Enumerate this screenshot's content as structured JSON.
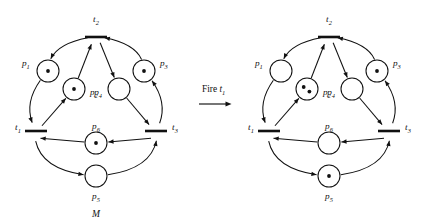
{
  "figure": {
    "caption_left": "M",
    "transition_arrow": {
      "label_prefix": "Fire ",
      "label_transition": "t",
      "label_subscript": "1",
      "icon": "right-arrow-icon"
    },
    "colors": {
      "stroke": "#111111",
      "background": "#ffffff",
      "token": "#111111"
    }
  },
  "nets": [
    {
      "id": "net-before",
      "name": "petri-net-before-firing",
      "marking_label": "M",
      "places": [
        {
          "id": "p1",
          "label": "p",
          "subscript": "1",
          "tokens": 1,
          "cx": 48,
          "cy": 71,
          "r": 11,
          "label_x": 22,
          "label_y": 66,
          "label_anchor": "start"
        },
        {
          "id": "p2",
          "label": "p",
          "subscript": "2",
          "tokens": 1,
          "cx": 74,
          "cy": 89,
          "r": 11,
          "label_x": 90,
          "label_y": 95,
          "label_anchor": "start"
        },
        {
          "id": "p3",
          "label": "p",
          "subscript": "3",
          "tokens": 1,
          "cx": 144,
          "cy": 71,
          "r": 11,
          "label_x": 160,
          "label_y": 66,
          "label_anchor": "start"
        },
        {
          "id": "p4",
          "label": "p",
          "subscript": "4",
          "tokens": 0,
          "cx": 119,
          "cy": 89,
          "r": 11,
          "label_x": 102,
          "label_y": 95,
          "label_anchor": "end"
        },
        {
          "id": "p5",
          "label": "p",
          "subscript": "5",
          "tokens": 0,
          "cx": 96,
          "cy": 176,
          "r": 11,
          "label_x": 96,
          "label_y": 199,
          "label_anchor": "middle"
        },
        {
          "id": "p6",
          "label": "p",
          "subscript": "6",
          "tokens": 1,
          "cx": 96,
          "cy": 143,
          "r": 11,
          "label_x": 96,
          "label_y": 129,
          "label_anchor": "middle"
        }
      ],
      "transitions": [
        {
          "id": "t1",
          "label": "t",
          "subscript": "1",
          "x": 36,
          "y": 131,
          "half": 11,
          "label_x": 18,
          "label_y": 130,
          "label_anchor": "middle"
        },
        {
          "id": "t2",
          "label": "t",
          "subscript": "2",
          "x": 96,
          "y": 37,
          "half": 11,
          "label_x": 96,
          "label_y": 22,
          "label_anchor": "middle"
        },
        {
          "id": "t3",
          "label": "t",
          "subscript": "3",
          "x": 156,
          "y": 131,
          "half": 11,
          "label_x": 175,
          "label_y": 130,
          "label_anchor": "middle"
        }
      ]
    },
    {
      "id": "net-after",
      "name": "petri-net-after-firing",
      "marking_label": "",
      "places": [
        {
          "id": "p1",
          "label": "p",
          "subscript": "1",
          "tokens": 0,
          "cx": 48,
          "cy": 71,
          "r": 11,
          "label_x": 22,
          "label_y": 66,
          "label_anchor": "start"
        },
        {
          "id": "p2",
          "label": "p",
          "subscript": "2",
          "tokens": 2,
          "cx": 74,
          "cy": 89,
          "r": 11,
          "label_x": 90,
          "label_y": 95,
          "label_anchor": "start"
        },
        {
          "id": "p3",
          "label": "p",
          "subscript": "3",
          "tokens": 1,
          "cx": 144,
          "cy": 71,
          "r": 11,
          "label_x": 160,
          "label_y": 66,
          "label_anchor": "start"
        },
        {
          "id": "p4",
          "label": "p",
          "subscript": "4",
          "tokens": 0,
          "cx": 119,
          "cy": 89,
          "r": 11,
          "label_x": 102,
          "label_y": 95,
          "label_anchor": "end"
        },
        {
          "id": "p5",
          "label": "p",
          "subscript": "5",
          "tokens": 1,
          "cx": 96,
          "cy": 176,
          "r": 11,
          "label_x": 96,
          "label_y": 199,
          "label_anchor": "middle"
        },
        {
          "id": "p6",
          "label": "p",
          "subscript": "6",
          "tokens": 0,
          "cx": 96,
          "cy": 143,
          "r": 11,
          "label_x": 96,
          "label_y": 129,
          "label_anchor": "middle"
        }
      ],
      "transitions": [
        {
          "id": "t1",
          "label": "t",
          "subscript": "1",
          "x": 36,
          "y": 131,
          "half": 11,
          "label_x": 18,
          "label_y": 130,
          "label_anchor": "middle"
        },
        {
          "id": "t2",
          "label": "t",
          "subscript": "2",
          "x": 96,
          "y": 37,
          "half": 11,
          "label_x": 96,
          "label_y": 22,
          "label_anchor": "middle"
        },
        {
          "id": "t3",
          "label": "t",
          "subscript": "3",
          "x": 156,
          "y": 131,
          "half": 11,
          "label_x": 175,
          "label_y": 130,
          "label_anchor": "middle"
        }
      ]
    }
  ],
  "arcs": [
    {
      "id": "t2-p1",
      "from": "t2",
      "to": "p1",
      "kind": "outer-left-upper"
    },
    {
      "id": "p1-t1",
      "from": "p1",
      "to": "t1",
      "kind": "outer-left-lower"
    },
    {
      "id": "t1-p2",
      "from": "t1",
      "to": "p2",
      "kind": "inner-left-lower"
    },
    {
      "id": "p2-t2",
      "from": "p2",
      "to": "t2",
      "kind": "inner-left-upper"
    },
    {
      "id": "t2-p4",
      "from": "t2",
      "to": "p4",
      "kind": "inner-right-upper"
    },
    {
      "id": "p4-t3",
      "from": "p4",
      "to": "t3",
      "kind": "inner-right-lower"
    },
    {
      "id": "t3-p3",
      "from": "t3",
      "to": "p3",
      "kind": "outer-right-lower"
    },
    {
      "id": "p3-t2",
      "from": "p3",
      "to": "t2",
      "kind": "outer-right-upper"
    },
    {
      "id": "t3-p6",
      "from": "t3",
      "to": "p6",
      "kind": "center-right"
    },
    {
      "id": "p6-t1",
      "from": "p6",
      "to": "t1",
      "kind": "center-left"
    },
    {
      "id": "t1-p5",
      "from": "t1",
      "to": "p5",
      "kind": "outer-bottom-left"
    },
    {
      "id": "p5-t3",
      "from": "p5",
      "to": "t3",
      "kind": "outer-bottom-right"
    }
  ]
}
